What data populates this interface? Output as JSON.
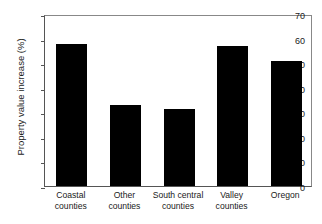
{
  "chart_data": {
    "type": "bar",
    "title": "",
    "xlabel": "",
    "ylabel": "Property value increase (%)",
    "categories": [
      "Coastal counties",
      "Other counties",
      "South central counties",
      "Valley counties",
      "Oregon"
    ],
    "category_lines": [
      [
        "Coastal",
        "counties"
      ],
      [
        "Other",
        "counties"
      ],
      [
        "South central",
        "counties"
      ],
      [
        "Valley",
        "counties"
      ],
      [
        "Oregon",
        ""
      ]
    ],
    "values": [
      58,
      33,
      31.5,
      57,
      51
    ],
    "ylim": [
      0,
      70
    ],
    "ytick_values": [
      0,
      10,
      20,
      30,
      40,
      50,
      60,
      70
    ],
    "ytick_labels": [
      "0",
      "10",
      "20",
      "30",
      "40",
      "50",
      "60",
      "70"
    ],
    "grid": false,
    "legend": null,
    "bar_color": "#000000",
    "axis_color": "#555555",
    "background_color": "#ffffff"
  }
}
